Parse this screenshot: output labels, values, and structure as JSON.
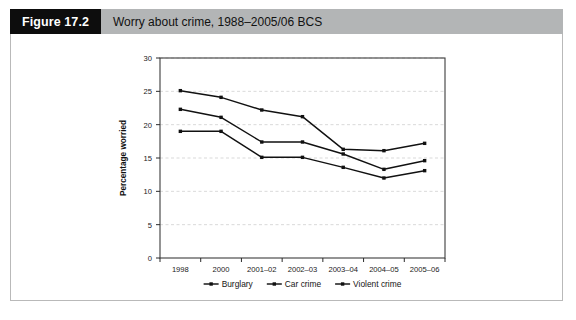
{
  "figure": {
    "tag": "Figure 17.2",
    "title": "Worry about crime, 1988–2005/06 BCS",
    "tag_bg": "#0d0d0d",
    "band_bg": "#b3b5b6",
    "frame_color": "#b9b9b9"
  },
  "chart_data": {
    "type": "line",
    "title": "Worry about crime, 1988–2005/06 BCS",
    "xlabel": "",
    "ylabel": "Percentage worried",
    "categories": [
      "1998",
      "2000",
      "2001–02",
      "2002–03",
      "2003–04",
      "2004–05",
      "2005–06"
    ],
    "ylim": [
      0,
      30
    ],
    "yticks": [
      0,
      5,
      10,
      15,
      20,
      25,
      30
    ],
    "ytick_labels": [
      "0",
      "5",
      "10",
      "15",
      "20",
      "25",
      "30"
    ],
    "grid": true,
    "grid_axis": "y",
    "grid_color": "#cfcfcf",
    "legend_position": "bottom",
    "marker": "square",
    "line_color": "#111111",
    "series": [
      {
        "name": "Burglary",
        "values": [
          25.1,
          24.1,
          22.2,
          21.2,
          16.3,
          16.1,
          17.2
        ]
      },
      {
        "name": "Car crime",
        "values": [
          22.3,
          21.1,
          17.4,
          17.4,
          15.6,
          13.3,
          14.6
        ]
      },
      {
        "name": "Violent crime",
        "values": [
          19.0,
          19.0,
          15.1,
          15.1,
          13.6,
          12.0,
          13.1
        ]
      }
    ]
  }
}
